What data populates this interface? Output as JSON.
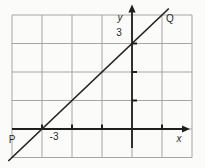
{
  "figure": {
    "colors": {
      "background": "#fbfbf9",
      "grid": "#a6a6a6",
      "axis": "#1e1e1e",
      "line": "#242424",
      "text": "#2b2b2b"
    }
  },
  "labels": {
    "y_axis": "y",
    "x_axis": "x",
    "y_intercept": "3",
    "x_intercept": "-3",
    "point_p": "P",
    "point_q": "Q"
  },
  "chart_data": {
    "type": "line",
    "grid": true,
    "grid_step": 1,
    "x_range": [
      -4,
      2
    ],
    "y_range": [
      -1,
      4
    ],
    "line": {
      "slope": 1,
      "y_intercept": 3,
      "x_intercept": -3,
      "equation": "y = x + 3"
    },
    "x_ticks": [
      -3,
      -2,
      -1,
      1
    ],
    "y_ticks": [
      1,
      2,
      3
    ],
    "labeled_points": [
      {
        "label": "-3",
        "on": "x-axis",
        "x": -3,
        "y": 0
      },
      {
        "label": "3",
        "on": "y-axis",
        "x": 0,
        "y": 3
      }
    ],
    "segment_endpoint_labels": [
      {
        "label": "P",
        "position": "lower-left",
        "x": -4.1,
        "y": -1.1
      },
      {
        "label": "Q",
        "position": "upper-right",
        "x": 1.2,
        "y": 4.2
      }
    ],
    "legend": false,
    "title": ""
  }
}
